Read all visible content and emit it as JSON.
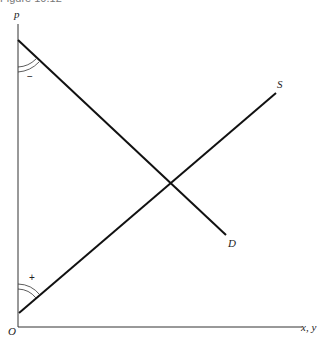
{
  "figure": {
    "caption": "Figure 10.12",
    "axes": {
      "y_label": "p",
      "x_label": "x, y",
      "origin_label": "O"
    },
    "curves": [
      {
        "name": "demand",
        "label": "D",
        "slope_sign": "−",
        "start": [
          18,
          40
        ],
        "end": [
          226,
          235
        ]
      },
      {
        "name": "supply",
        "label": "S",
        "slope_sign": "+",
        "start": [
          19,
          313
        ],
        "end": [
          276,
          93
        ]
      }
    ],
    "intersection": [
      169,
      182
    ],
    "colors": {
      "line": "#111111",
      "axis": "#333333",
      "background": "#ffffff"
    }
  }
}
